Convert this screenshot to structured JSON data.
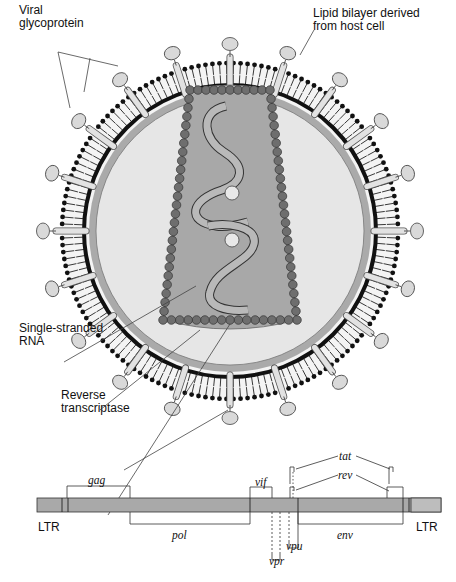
{
  "virion": {
    "labels": {
      "glycoprotein": "Viral\nglycoprotein",
      "bilayer": "Lipid bilayer derived\nfrom host cell",
      "rna": "Single-stranded\nRNA",
      "rt": "Reverse\ntranscriptase"
    },
    "colors": {
      "glycoprotein_head": "#d9d9d9",
      "glycoprotein_stalk": "#e2e2e2",
      "lipid_head": "#111111",
      "matrix": "#aaaaaa",
      "interior": "#e6e6e6",
      "capsid_fill": "#a8a8a8",
      "capsid_bead": "#6e6e6e",
      "rna_tube": "#b9b9b9"
    }
  },
  "genome": {
    "ltr_left": "LTR",
    "ltr_right": "LTR",
    "genes": {
      "gag": "gag",
      "pol": "pol",
      "vif": "vif",
      "vpr": "vpr",
      "vpu": "vpu",
      "tat": "tat",
      "rev": "rev",
      "env": "env"
    },
    "bar_color": "#a9a9a9"
  }
}
